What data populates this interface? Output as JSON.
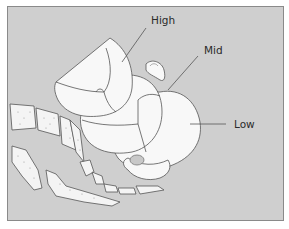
{
  "figure": {
    "type": "anatomical-diagram",
    "colors": {
      "background_fill": "#cfcfcf",
      "frame_border": "#8a8a8a",
      "head_fill": "#f8f8f8",
      "outline": "#555555",
      "bone_fill": "#f4f4f4",
      "bone_dots": "#9a9a9a",
      "leader_line": "#555555"
    },
    "labels": [
      {
        "id": "high",
        "text": "High"
      },
      {
        "id": "mid",
        "text": "Mid"
      },
      {
        "id": "low",
        "text": "Low"
      }
    ]
  }
}
